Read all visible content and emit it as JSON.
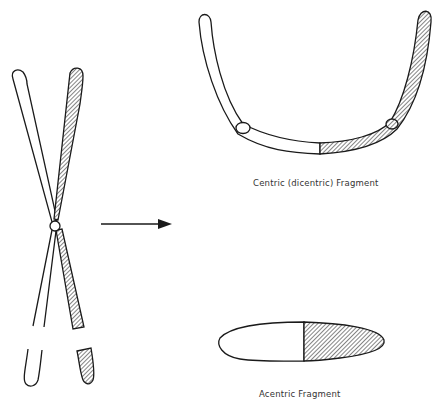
{
  "diagram": {
    "type": "chromosome-breakage-fusion",
    "colors": {
      "stroke": "#1a1a1a",
      "fill_light": "#ffffff",
      "hatch": "#333333",
      "background": "#ffffff"
    },
    "left": {
      "description": "Two crossed chromatids joined at a centromere, one plain and one hatched, with breaks near the lower ends"
    },
    "arrow": {
      "direction": "right"
    },
    "right_top": {
      "label": "Centric (dicentric) Fragment"
    },
    "right_bottom": {
      "label": "Acentric Fragment"
    }
  }
}
